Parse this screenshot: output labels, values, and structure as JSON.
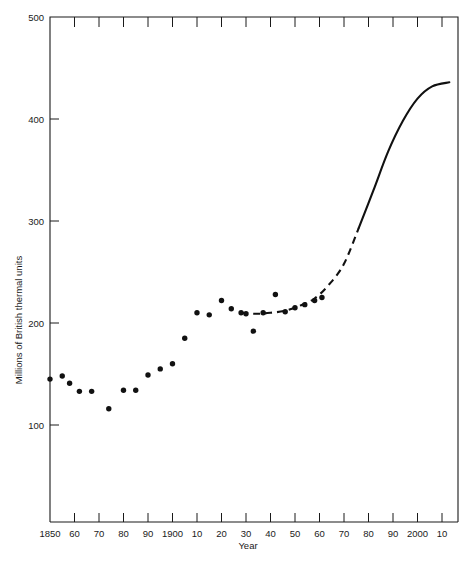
{
  "chart_data": {
    "type": "scatter",
    "title": "",
    "xlabel": "Year",
    "ylabel": "Millions of British thermal units",
    "xlim": [
      1850,
      2013
    ],
    "ylim": [
      0,
      500
    ],
    "grid": false,
    "legend": "none",
    "y_ticks": [
      500,
      400,
      300,
      200,
      100
    ],
    "y_tick_labels": [
      "500",
      "400",
      "300",
      "200",
      "100"
    ],
    "y_minor_ticks": [
      450,
      350,
      250,
      150,
      50
    ],
    "x_ticks": [
      1850,
      1860,
      1870,
      1880,
      1890,
      1900,
      1910,
      1920,
      1930,
      1940,
      1950,
      1960,
      1970,
      1980,
      1990,
      2000,
      2010
    ],
    "x_tick_labels": [
      "1850",
      "60",
      "70",
      "80",
      "90",
      "1900",
      "10",
      "20",
      "30",
      "40",
      "50",
      "60",
      "70",
      "80",
      "90",
      "2000",
      "10"
    ],
    "series": [
      {
        "name": "Energy use per capita (observed)",
        "marker": "filled-circle",
        "color": "#111111",
        "points": [
          {
            "x": 1850,
            "y": 145
          },
          {
            "x": 1855,
            "y": 148
          },
          {
            "x": 1858,
            "y": 141
          },
          {
            "x": 1862,
            "y": 133
          },
          {
            "x": 1867,
            "y": 133
          },
          {
            "x": 1874,
            "y": 116
          },
          {
            "x": 1880,
            "y": 134
          },
          {
            "x": 1885,
            "y": 134
          },
          {
            "x": 1890,
            "y": 149
          },
          {
            "x": 1895,
            "y": 155
          },
          {
            "x": 1900,
            "y": 160
          },
          {
            "x": 1905,
            "y": 185
          },
          {
            "x": 1910,
            "y": 210
          },
          {
            "x": 1915,
            "y": 208
          },
          {
            "x": 1920,
            "y": 222
          },
          {
            "x": 1924,
            "y": 214
          },
          {
            "x": 1928,
            "y": 210
          },
          {
            "x": 1930,
            "y": 209
          },
          {
            "x": 1933,
            "y": 192
          },
          {
            "x": 1937,
            "y": 210
          },
          {
            "x": 1942,
            "y": 228
          },
          {
            "x": 1946,
            "y": 211
          },
          {
            "x": 1950,
            "y": 215
          },
          {
            "x": 1954,
            "y": 218
          },
          {
            "x": 1958,
            "y": 222
          },
          {
            "x": 1961,
            "y": 225
          }
        ]
      },
      {
        "name": "Projected trend (dashed then solid)",
        "marker": "none",
        "color": "#111111",
        "style": "dashed-to-solid",
        "points": [
          {
            "x": 1928,
            "y": 210
          },
          {
            "x": 1934,
            "y": 209
          },
          {
            "x": 1940,
            "y": 210
          },
          {
            "x": 1946,
            "y": 212
          },
          {
            "x": 1952,
            "y": 217
          },
          {
            "x": 1958,
            "y": 224
          },
          {
            "x": 1964,
            "y": 238
          },
          {
            "x": 1970,
            "y": 258
          },
          {
            "x": 1976,
            "y": 293
          },
          {
            "x": 1982,
            "y": 330
          },
          {
            "x": 1988,
            "y": 368
          },
          {
            "x": 1994,
            "y": 398
          },
          {
            "x": 2000,
            "y": 420
          },
          {
            "x": 2006,
            "y": 432
          },
          {
            "x": 2013,
            "y": 436
          }
        ],
        "dash_until_x": 1976
      }
    ]
  },
  "axes": {
    "y_title": "Millions of British thermal units",
    "x_title": "Year"
  }
}
